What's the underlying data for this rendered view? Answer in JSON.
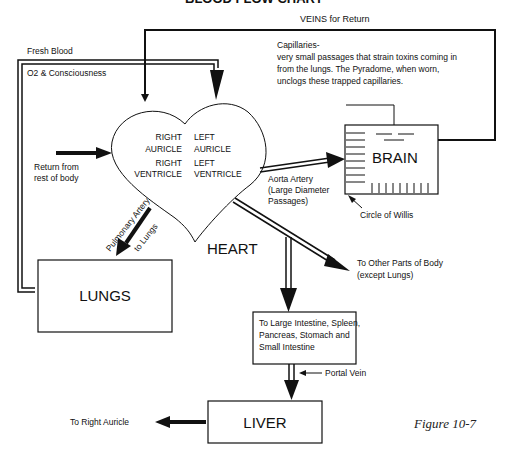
{
  "title": "BLOOD FLOW CHART",
  "labels": {
    "veins_return": "VEINS for Return",
    "fresh_blood": "Fresh Blood",
    "o2": "O2 & Consciousness",
    "capillaries_title": "Capillaries-",
    "capillaries_lines": [
      "very small passages that strain toxins coming in",
      "from the lungs. The Pyradome, when worn,",
      "unclogs these trapped capillaries."
    ],
    "return_from": [
      "Return from",
      "rest of body"
    ],
    "heart_chambers": {
      "right_auricle": [
        "RIGHT",
        "AURICLE"
      ],
      "left_auricle": [
        "LEFT",
        "AURICLE"
      ],
      "right_ventricle": [
        "RIGHT",
        "VENTRICLE"
      ],
      "left_ventricle": [
        "LEFT",
        "VENTRICLE"
      ]
    },
    "heart": "HEART",
    "brain": "BRAIN",
    "aorta": [
      "Aorta Artery",
      "(Large Diameter",
      "Passages)"
    ],
    "circle_of_willis": "Circle of Willis",
    "pulmonary_artery": "Pulmonary Artery",
    "to_lungs": "to Lungs",
    "lungs": "LUNGS",
    "other_parts": [
      "To Other Parts of Body",
      "(except Lungs)"
    ],
    "intestine_box": [
      "To Large Intestine, Spleen,",
      "Pancreas, Stomach and",
      "Small Intestine"
    ],
    "portal_vein": "Portal Vein",
    "liver": "LIVER",
    "to_right_auricle": "To Right Auricle",
    "figure": "Figure 10-7"
  },
  "colors": {
    "ink": "#111111",
    "background": "#ffffff"
  }
}
